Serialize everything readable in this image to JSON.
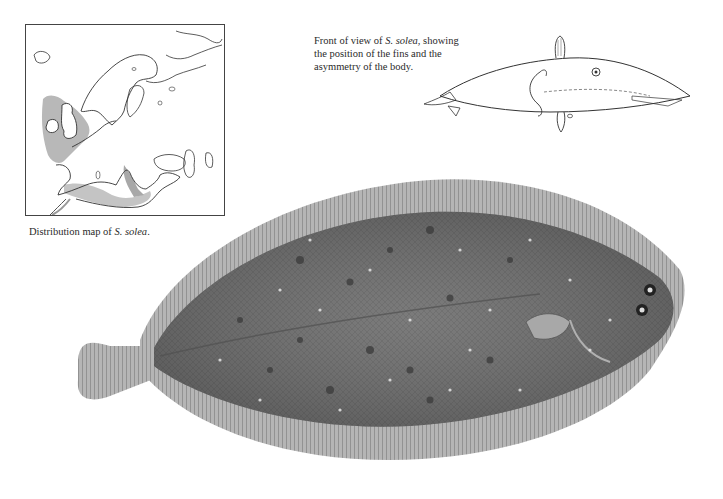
{
  "map": {
    "caption_prefix": "Distribution map of ",
    "caption_species": "S. solea",
    "caption_suffix": ".",
    "shading_color": "#b8b8b8",
    "outline_color": "#333333"
  },
  "front_view": {
    "caption_prefix": "Front of view of ",
    "caption_species": "S. solea",
    "caption_suffix": ", showing the position of the fins and the asymmetry of the body."
  },
  "main_illustration": {
    "subject": "Common sole (Solea solea), eyed side, dorsal view",
    "body_color": "#6f6f6f",
    "fin_color": "#9a9a9a",
    "spot_color": "#3a3a3a",
    "highlight_color": "#e6e6e6"
  }
}
